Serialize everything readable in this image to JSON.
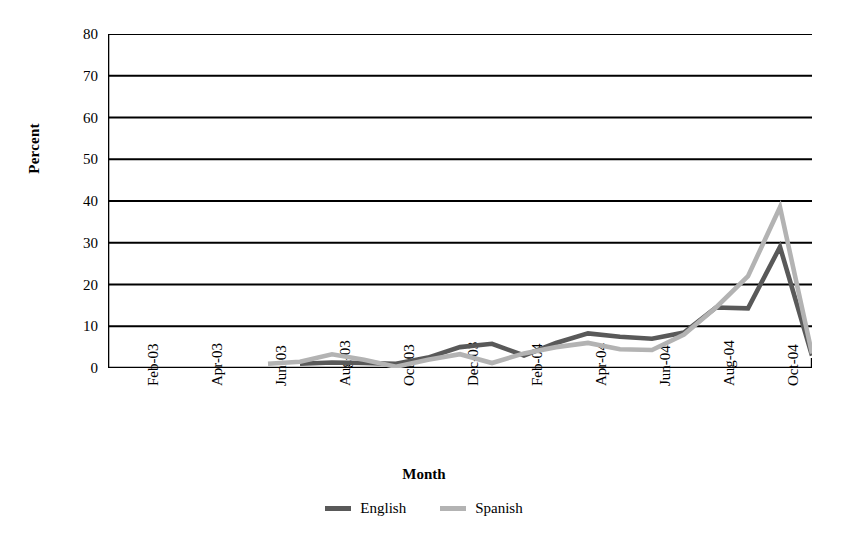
{
  "chart_data": {
    "type": "line",
    "title": "",
    "xlabel": "Month",
    "ylabel": "Percent",
    "ylim": [
      0,
      80
    ],
    "ytick_step": 10,
    "grid": true,
    "legend_position": "bottom",
    "x": [
      "Jan-03",
      "Feb-03",
      "Mar-03",
      "Apr-03",
      "May-03",
      "Jun-03",
      "Jul-03",
      "Aug-03",
      "Sep-03",
      "Oct-03",
      "Nov-03",
      "Dec-03",
      "Jan-04",
      "Feb-04",
      "Mar-04",
      "Apr-04",
      "May-04",
      "Jun-04",
      "Jul-04",
      "Aug-04",
      "Sep-04",
      "Oct-04",
      "Nov-04"
    ],
    "xtick_labels": [
      "Feb-03",
      "Apr-03",
      "Jun-03",
      "Aug-03",
      "Oct-03",
      "Dec-03",
      "Feb-04",
      "Apr-04",
      "Jun-04",
      "Aug-04",
      "Oct-04"
    ],
    "ytick_labels": [
      "80",
      "70",
      "60",
      "50",
      "40",
      "30",
      "20",
      "10",
      "0"
    ],
    "series": [
      {
        "name": "English",
        "color": "#595959",
        "values": [
          null,
          null,
          null,
          null,
          null,
          null,
          1.0,
          1.3,
          1.2,
          1.0,
          2.5,
          5.0,
          5.8,
          3.0,
          6.0,
          8.3,
          7.5,
          7.0,
          8.5,
          14.5,
          14.3,
          29.0,
          3.0
        ]
      },
      {
        "name": "Spanish",
        "color": "#b3b3b3",
        "values": [
          null,
          null,
          null,
          null,
          null,
          1.0,
          1.5,
          3.3,
          2.0,
          0.3,
          2.0,
          3.3,
          1.2,
          3.5,
          5.0,
          6.0,
          4.5,
          4.3,
          8.0,
          14.5,
          22.0,
          38.5,
          3.5
        ]
      }
    ]
  },
  "legend": {
    "entries": [
      {
        "label": "English"
      },
      {
        "label": "Spanish"
      }
    ]
  },
  "axes": {
    "y_title": "Percent",
    "x_title": "Month"
  }
}
